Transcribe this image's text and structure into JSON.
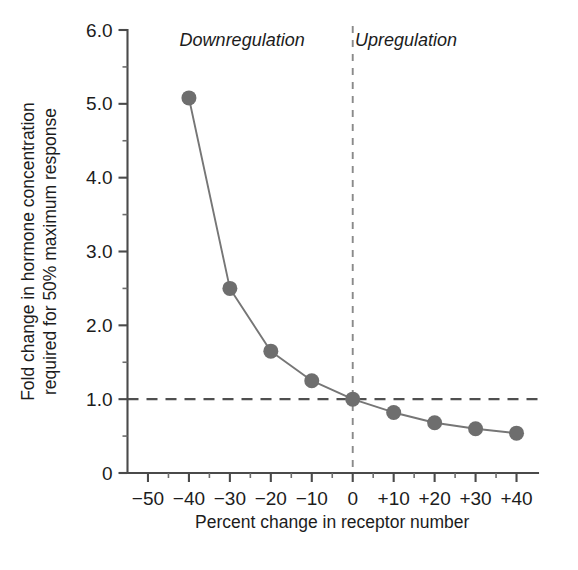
{
  "chart_data": {
    "type": "line",
    "title": "",
    "xlabel": "Percent change in receptor number",
    "ylabel_line1": "Fold change in hormone concentration",
    "ylabel_line2": "required for 50% maximum response",
    "x": [
      -40,
      -30,
      -20,
      -10,
      0,
      10,
      20,
      30,
      40
    ],
    "values": [
      5.08,
      2.5,
      1.65,
      1.25,
      1.0,
      0.82,
      0.68,
      0.6,
      0.54
    ],
    "series": [
      {
        "name": "Fold change in hormone concentration",
        "values": [
          5.08,
          2.5,
          1.65,
          1.25,
          1.0,
          0.82,
          0.68,
          0.6,
          0.54
        ]
      }
    ],
    "xlim": [
      -55,
      45
    ],
    "ylim": [
      0,
      6.0
    ],
    "xticks": [
      -50,
      -40,
      -30,
      -20,
      -10,
      0,
      10,
      20,
      30,
      40
    ],
    "xticklabels": [
      "−50",
      "−40",
      "−30",
      "−20",
      "−10",
      "0",
      "+10",
      "+20",
      "+30",
      "+40"
    ],
    "yticks": [
      0,
      1.0,
      2.0,
      3.0,
      4.0,
      5.0,
      6.0
    ],
    "yticklabels": [
      "0",
      "1.0",
      "2.0",
      "3.0",
      "4.0",
      "5.0",
      "6.0"
    ],
    "y_minor_ticks": [
      0.5,
      1.5,
      2.5,
      3.5,
      4.5,
      5.5
    ],
    "x_minor_ticks": [
      -45,
      -35,
      -25,
      -15,
      -5,
      5,
      15,
      25,
      35
    ],
    "grid": false,
    "legend": "none",
    "annotations": [
      {
        "name": "downregulation",
        "text": "Downregulation",
        "x": -27,
        "y": 5.78,
        "style": "italic"
      },
      {
        "name": "upregulation",
        "text": "Upregulation",
        "x": 13,
        "y": 5.78,
        "style": "italic"
      }
    ],
    "reference_lines": [
      {
        "name": "unity-fold-change",
        "orientation": "horizontal",
        "value": 1.0,
        "style": "dashed"
      },
      {
        "name": "zero-percent-change",
        "orientation": "vertical",
        "value": 0,
        "style": "dashed"
      }
    ],
    "colors": {
      "marker": "#6e6e6e",
      "line": "#767676",
      "axis": "#4a4a4a",
      "text": "#1c1c1c",
      "reference": "#4f4f4f",
      "background": "#ffffff"
    },
    "marker": {
      "shape": "circle",
      "radius_px": 7.5
    }
  }
}
